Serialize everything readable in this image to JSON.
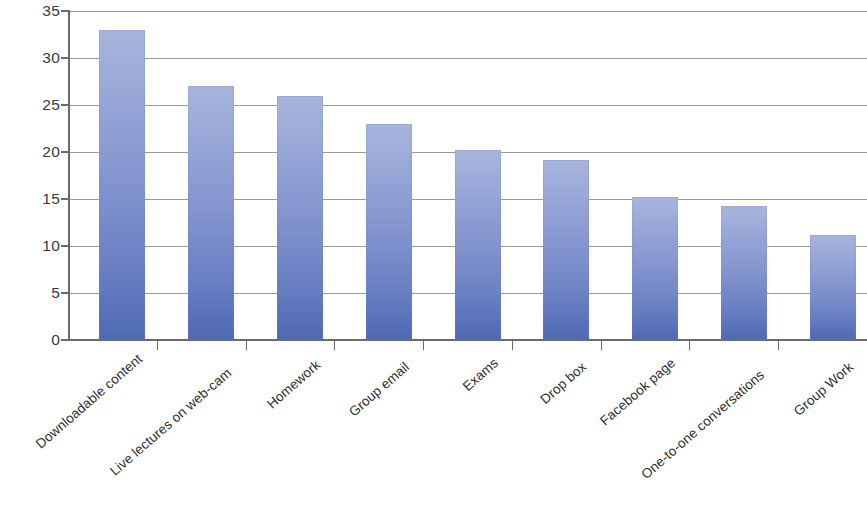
{
  "chart_data": {
    "type": "bar",
    "title": "",
    "subtitle": "",
    "xlabel": "",
    "ylabel": "",
    "categories": [
      "Downloadable content",
      "Live lectures on web-cam",
      "Homework",
      "Group email",
      "Exams",
      "Drop box",
      "Facebook page",
      "One-to-one conversations",
      "Group Work"
    ],
    "values": [
      33,
      27,
      26,
      23,
      20.2,
      19.2,
      15.2,
      14.3,
      11.2
    ],
    "ylim": [
      0,
      35
    ],
    "ytick_labels": [
      "35",
      "30",
      "25",
      "20",
      "15",
      "10",
      "5",
      "0"
    ],
    "ytick_values": [
      35,
      30,
      25,
      20,
      15,
      10,
      5,
      0
    ],
    "grid": true,
    "legend": false,
    "legend_position": "none",
    "bar_color_top": "#a7b4dd",
    "bar_color_bottom": "#4f68b4",
    "gridline_color": "#8a8a8a",
    "axis_color": "#6b6b6b",
    "text_color": "#2e2e2e",
    "background": "#ffffff"
  }
}
